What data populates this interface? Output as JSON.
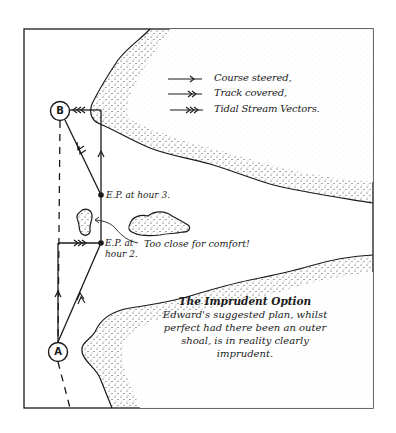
{
  "legend": {
    "items": [
      {
        "label": "Course steered,",
        "arrow": "single-chevron"
      },
      {
        "label": "Track covered,",
        "arrow": "double-chevron"
      },
      {
        "label": "Tidal Stream Vectors.",
        "arrow": "triple-chevron"
      }
    ]
  },
  "points": {
    "start": "A",
    "destination": "B",
    "ep_hour3": "E.P. at hour 3.",
    "ep_hour2_line1": "E.P. at",
    "ep_hour2_line2": "hour 2."
  },
  "annotation": {
    "warning": "Too close for comfort!"
  },
  "caption": {
    "title": "The Imprudent Option",
    "line1": "Edward's suggested plan, whilst",
    "line2": "perfect had there been an outer",
    "line3": "shoal, is in reality clearly",
    "line4": "imprudent."
  },
  "colors": {
    "ink": "#1a1a1a",
    "paper": "#ffffff"
  }
}
